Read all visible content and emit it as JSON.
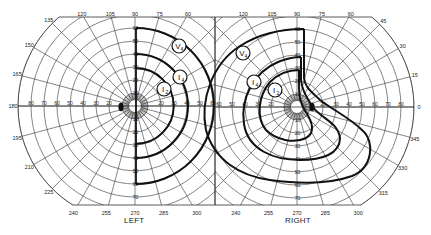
{
  "diagram": {
    "type": "goldmann_visual_field",
    "colors": {
      "ink": "#222222",
      "grid": "#333333",
      "background": "#ffffff"
    },
    "fields": [
      {
        "id": "left",
        "label": "LEFT",
        "center": [
          135,
          106
        ],
        "side": "left",
        "angle_labels": [
          {
            "deg": 90,
            "text": "90"
          },
          {
            "deg": 105,
            "text": "105"
          },
          {
            "deg": 120,
            "text": "120"
          },
          {
            "deg": 135,
            "text": "135"
          },
          {
            "deg": 150,
            "text": "150"
          },
          {
            "deg": 165,
            "text": "165"
          },
          {
            "deg": 180,
            "text": "180"
          },
          {
            "deg": 195,
            "text": "195"
          },
          {
            "deg": 210,
            "text": "210"
          },
          {
            "deg": 225,
            "text": "225"
          },
          {
            "deg": 240,
            "text": "240"
          },
          {
            "deg": 255,
            "text": "255"
          },
          {
            "deg": 270,
            "text": "270"
          },
          {
            "deg": 285,
            "text": "285"
          },
          {
            "deg": 300,
            "text": "300"
          },
          {
            "deg": 75,
            "text": "75"
          },
          {
            "deg": 60,
            "text": "60"
          }
        ],
        "radial_labels_horizontal": [
          "80",
          "70",
          "60",
          "50",
          "40",
          "30",
          "20"
        ],
        "radial_labels_horizontal_right": [
          "20",
          "30",
          "40",
          "50",
          "60"
        ],
        "radial_labels_vertical": [
          "60",
          "50",
          "40",
          "30",
          "20",
          "10",
          "10",
          "20",
          "30",
          "40",
          "50",
          "60",
          "70"
        ],
        "isopters": [
          {
            "name": "V4",
            "label_main": "V",
            "label_sub": "4",
            "radius_deg": 60,
            "label_pos": [
              179,
              46
            ]
          },
          {
            "name": "I4",
            "label_main": "I",
            "label_sub": "4",
            "radius_deg": 40,
            "label_pos": [
              180,
              77
            ]
          },
          {
            "name": "I2",
            "label_main": "I",
            "label_sub": "2",
            "radius_deg": 29,
            "label_pos": [
              164,
              89
            ]
          }
        ],
        "blind_spot": [
          121,
          107
        ]
      },
      {
        "id": "right",
        "label": "RIGHT",
        "center": [
          297,
          107
        ],
        "side": "right",
        "angle_labels": [
          {
            "deg": 120,
            "text": "120"
          },
          {
            "deg": 105,
            "text": "105"
          },
          {
            "deg": 90,
            "text": "90"
          },
          {
            "deg": 75,
            "text": "75"
          },
          {
            "deg": 60,
            "text": "60"
          },
          {
            "deg": 45,
            "text": "45"
          },
          {
            "deg": 30,
            "text": "30"
          },
          {
            "deg": 15,
            "text": "15"
          },
          {
            "deg": 0,
            "text": "0"
          },
          {
            "deg": 345,
            "text": "345"
          },
          {
            "deg": 330,
            "text": "330"
          },
          {
            "deg": 315,
            "text": "315"
          },
          {
            "deg": 300,
            "text": "300"
          },
          {
            "deg": 285,
            "text": "285"
          },
          {
            "deg": 270,
            "text": "270"
          },
          {
            "deg": 255,
            "text": "255"
          },
          {
            "deg": 240,
            "text": "240"
          }
        ],
        "radial_labels_horizontal": [
          "20",
          "30",
          "40",
          "50",
          "60",
          "70",
          "80"
        ],
        "radial_labels_horizontal_left": [
          "60",
          "50",
          "40",
          "30",
          "20"
        ],
        "radial_labels_vertical": [
          "60",
          "50",
          "40",
          "30",
          "20",
          "10",
          "10",
          "20",
          "30",
          "40",
          "50",
          "60",
          "70"
        ],
        "isopters": [
          {
            "name": "V4",
            "label_main": "V",
            "label_sub": "4",
            "label_pos": [
              243,
              53
            ]
          },
          {
            "name": "I4",
            "label_main": "I",
            "label_sub": "4",
            "label_pos": [
              254,
              82
            ]
          },
          {
            "name": "I2",
            "label_main": "I",
            "label_sub": "2",
            "label_pos": [
              275,
              90
            ]
          }
        ],
        "blind_spot": [
          312,
          107
        ]
      }
    ],
    "scale_px_per_deg": 1.3
  }
}
